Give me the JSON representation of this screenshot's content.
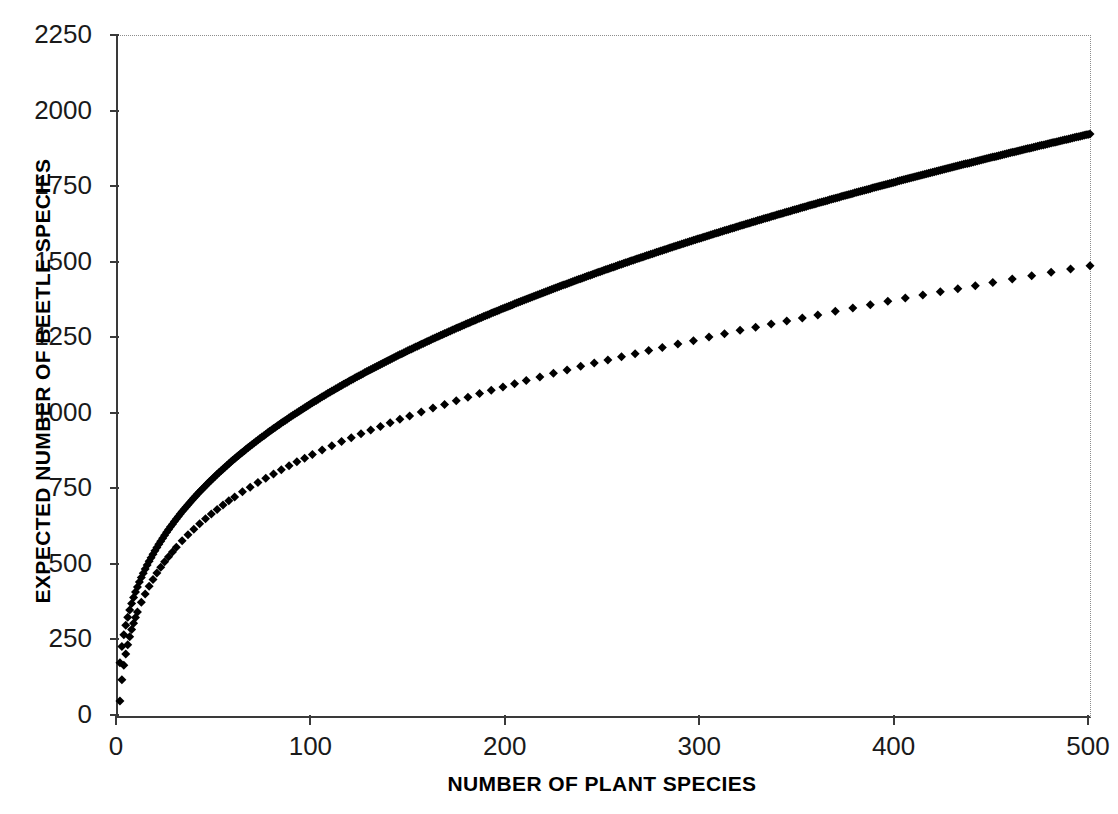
{
  "chart_data": {
    "type": "scatter",
    "title": "",
    "xlabel": "NUMBER OF PLANT SPECIES",
    "ylabel": "EXPECTED NUMBER OF BEETLE SPECIES",
    "xlim": [
      0,
      500
    ],
    "ylim": [
      0,
      2250
    ],
    "xticks": [
      0,
      100,
      200,
      300,
      400,
      500
    ],
    "yticks": [
      0,
      250,
      500,
      750,
      1000,
      1250,
      1500,
      1750,
      2000,
      2250
    ],
    "grid": false,
    "legend": null,
    "marker": "diamond",
    "marker_color": "#000000",
    "marker_size_px": 9,
    "series": [
      {
        "name": "expected beetle species",
        "x": [
          1,
          2,
          3,
          4,
          5,
          6,
          7,
          8,
          9,
          10,
          12,
          14,
          16,
          18,
          20,
          22,
          24,
          26,
          28,
          30,
          33,
          36,
          39,
          42,
          45,
          48,
          51,
          54,
          57,
          60,
          64,
          68,
          72,
          76,
          80,
          84,
          88,
          92,
          96,
          100,
          105,
          110,
          115,
          120,
          125,
          130,
          135,
          140,
          145,
          150,
          156,
          162,
          168,
          174,
          180,
          186,
          192,
          198,
          204,
          210,
          217,
          224,
          231,
          238,
          245,
          252,
          259,
          266,
          273,
          280,
          288,
          296,
          304,
          312,
          320,
          328,
          336,
          344,
          352,
          360,
          369,
          378,
          387,
          396,
          405,
          414,
          423,
          432,
          441,
          450,
          460,
          470,
          480,
          490,
          500
        ],
        "y": [
          50,
          120,
          168,
          205,
          236,
          262,
          286,
          307,
          326,
          344,
          376,
          404,
          429,
          452,
          473,
          492,
          510,
          527,
          543,
          558,
          580,
          600,
          618,
          636,
          653,
          668,
          683,
          698,
          712,
          725,
          742,
          757,
          773,
          787,
          801,
          815,
          828,
          841,
          853,
          865,
          880,
          894,
          908,
          921,
          934,
          946,
          958,
          970,
          982,
          993,
          1006,
          1019,
          1031,
          1043,
          1055,
          1067,
          1078,
          1089,
          1099,
          1110,
          1122,
          1134,
          1145,
          1157,
          1168,
          1178,
          1189,
          1199,
          1209,
          1219,
          1231,
          1242,
          1254,
          1265,
          1276,
          1286,
          1297,
          1307,
          1317,
          1327,
          1339,
          1350,
          1361,
          1372,
          1383,
          1393,
          1404,
          1414,
          1424,
          1434,
          1446,
          1457,
          1468,
          1479,
          1490
        ],
        "description": "power-law species accumulation curve"
      }
    ],
    "fitted_model": {
      "form": "y = c * x^z",
      "c": 176,
      "z": 0.385,
      "y_at_x1": 50,
      "y_at_x100": 1042,
      "y_at_x500": 1935
    }
  },
  "axes": {
    "x": {
      "label": "NUMBER OF PLANT SPECIES",
      "ticks": [
        {
          "value": 0,
          "label": "0"
        },
        {
          "value": 100,
          "label": "100"
        },
        {
          "value": 200,
          "label": "200"
        },
        {
          "value": 300,
          "label": "300"
        },
        {
          "value": 400,
          "label": "400"
        },
        {
          "value": 500,
          "label": "500"
        }
      ]
    },
    "y": {
      "label": "EXPECTED NUMBER OF BEETLE SPECIES",
      "ticks": [
        {
          "value": 0,
          "label": "0"
        },
        {
          "value": 250,
          "label": "250"
        },
        {
          "value": 500,
          "label": "500"
        },
        {
          "value": 750,
          "label": "750"
        },
        {
          "value": 1000,
          "label": "1000"
        },
        {
          "value": 1250,
          "label": "1250"
        },
        {
          "value": 1500,
          "label": "1500"
        },
        {
          "value": 1750,
          "label": "1750"
        },
        {
          "value": 2000,
          "label": "2000"
        },
        {
          "value": 2250,
          "label": "2250"
        }
      ]
    }
  },
  "colors": {
    "marker": "#000000",
    "axis": "#3a3a3a",
    "frame": "#8d8d8d",
    "text": "#1a1a1a",
    "background": "#ffffff"
  }
}
